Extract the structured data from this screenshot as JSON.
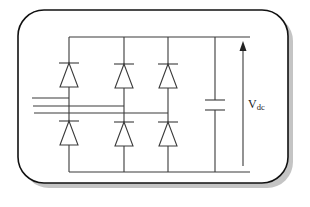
{
  "diagram": {
    "label_main": "V",
    "label_sub": "dc",
    "colors": {
      "stroke": "#3a3a3a",
      "frame": "#111111",
      "shadow": "#bdbdbd",
      "background": "#ffffff"
    },
    "components": {
      "diodes_upper": 3,
      "diodes_lower": 3,
      "ac_input_lines": 3,
      "capacitor": 1,
      "voltage_arrow": "up"
    }
  }
}
